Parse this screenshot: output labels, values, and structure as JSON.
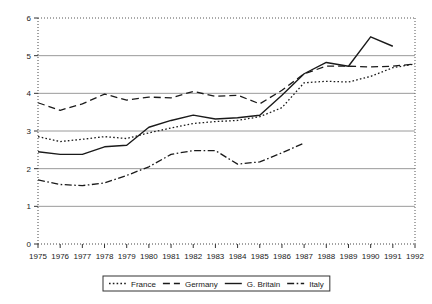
{
  "chart_data": {
    "type": "line",
    "title": "",
    "xlabel": "",
    "ylabel": "",
    "xlim": [
      1975,
      1992
    ],
    "ylim": [
      0,
      6
    ],
    "grid": true,
    "legend_position": "bottom",
    "x": [
      1975,
      1976,
      1977,
      1978,
      1979,
      1980,
      1981,
      1982,
      1983,
      1984,
      1985,
      1986,
      1987,
      1988,
      1989,
      1990,
      1991,
      1992
    ],
    "categories": [
      "1975",
      "1976",
      "1977",
      "1978",
      "1979",
      "1980",
      "1981",
      "1982",
      "1983",
      "1984",
      "1985",
      "1986",
      "1987",
      "1988",
      "1989",
      "1990",
      "1991",
      "1992"
    ],
    "ytick_labels": [
      "0",
      "1",
      "2",
      "3",
      "4",
      "5",
      "6"
    ],
    "ytick_values": [
      0,
      1,
      2,
      3,
      4,
      5,
      6
    ],
    "series": [
      {
        "name": "France",
        "style": "dotted",
        "color": "#1a1a1a",
        "values": [
          2.85,
          2.72,
          2.78,
          2.85,
          2.8,
          2.95,
          3.08,
          3.2,
          3.25,
          3.28,
          3.38,
          3.62,
          4.28,
          4.32,
          4.3,
          4.45,
          4.68,
          4.78
        ]
      },
      {
        "name": "Germany",
        "style": "dashed",
        "color": "#1a1a1a",
        "values": [
          3.75,
          3.55,
          3.72,
          3.98,
          3.82,
          3.9,
          3.88,
          4.05,
          3.92,
          3.95,
          3.72,
          4.08,
          4.52,
          4.72,
          4.72,
          4.7,
          4.72,
          4.78
        ]
      },
      {
        "name": "G. Britain",
        "style": "solid",
        "color": "#1a1a1a",
        "values": [
          2.45,
          2.38,
          2.38,
          2.58,
          2.62,
          3.1,
          3.28,
          3.42,
          3.32,
          3.35,
          3.42,
          3.95,
          4.52,
          4.82,
          4.72,
          5.5,
          5.25,
          null
        ]
      },
      {
        "name": "Italy",
        "style": "dashdot",
        "color": "#1a1a1a",
        "values": [
          1.7,
          1.58,
          1.55,
          1.62,
          1.82,
          2.05,
          2.38,
          2.48,
          2.48,
          2.12,
          2.18,
          2.42,
          2.68,
          null,
          null,
          null,
          null,
          null
        ]
      }
    ]
  },
  "legend": {
    "items": [
      {
        "label": "France",
        "style": "dotted"
      },
      {
        "label": "Germany",
        "style": "dashed"
      },
      {
        "label": "G. Britain",
        "style": "solid"
      },
      {
        "label": "Italy",
        "style": "dashdot"
      }
    ]
  }
}
